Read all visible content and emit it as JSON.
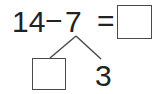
{
  "problem": {
    "minuend": "14",
    "operator": "−",
    "subtrahend": "7",
    "equals": "=",
    "answer_value": ""
  },
  "decomposition": {
    "part_left_value": "",
    "part_right": "3"
  },
  "colors": {
    "text": "#222222",
    "stroke": "#4a4a4a",
    "background": "#ffffff"
  }
}
